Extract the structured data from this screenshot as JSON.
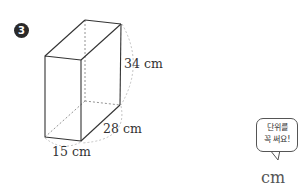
{
  "problem": {
    "number": "3",
    "shape": "rectangular prism",
    "dimensions": {
      "height": "34 cm",
      "depth": "28 cm",
      "width": "15 cm"
    }
  },
  "hint_bubble": {
    "line1": "단위를",
    "line2": "꼭 써요!"
  },
  "answer_unit": "cm"
}
